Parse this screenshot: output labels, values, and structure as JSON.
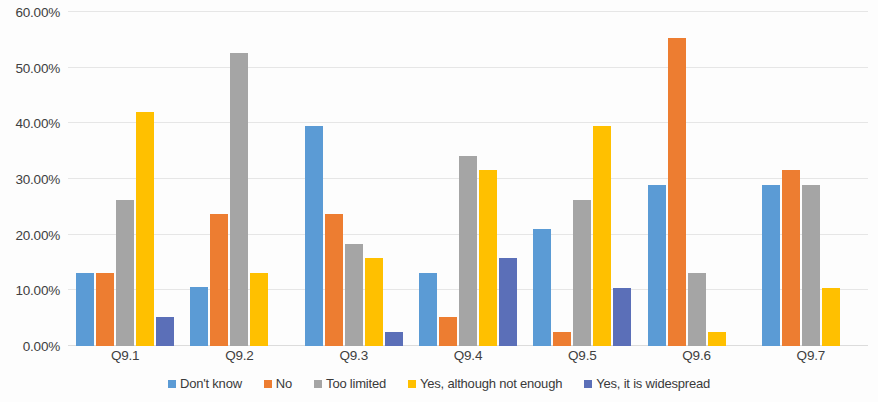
{
  "chart_data": {
    "type": "bar",
    "title": "",
    "subtitle": "",
    "xlabel": "",
    "ylabel": "",
    "categories": [
      "Q9.1",
      "Q9.2",
      "Q9.3",
      "Q9.4",
      "Q9.5",
      "Q9.6",
      "Q9.7"
    ],
    "ylim": [
      0,
      60
    ],
    "ytick_values": [
      0,
      10,
      20,
      30,
      40,
      50,
      60
    ],
    "ytick_labels": [
      "0.00%",
      "10.00%",
      "20.00%",
      "30.00%",
      "40.00%",
      "50.00%",
      "60.00%"
    ],
    "grid": true,
    "legend_position": "bottom",
    "grouping": "clustered",
    "value_suffix": "%",
    "series": [
      {
        "name": "Don't know",
        "color": "#5B9BD5",
        "values": [
          13.2,
          10.6,
          39.5,
          13.2,
          21.1,
          28.9,
          28.9
        ]
      },
      {
        "name": "No",
        "color": "#ED7D31",
        "values": [
          13.2,
          23.7,
          23.7,
          5.3,
          2.6,
          55.3,
          31.6
        ]
      },
      {
        "name": "Too limited",
        "color": "#A5A5A5",
        "values": [
          26.3,
          52.6,
          18.4,
          34.2,
          26.3,
          13.2,
          28.9
        ]
      },
      {
        "name": "Yes, although not enough",
        "color": "#FFC000",
        "values": [
          42.1,
          13.2,
          15.8,
          31.6,
          39.5,
          2.6,
          10.5
        ]
      },
      {
        "name": "Yes, it is widespread",
        "color": "#5B6FB8",
        "values": [
          5.3,
          null,
          2.6,
          15.8,
          10.5,
          null,
          null
        ]
      }
    ]
  },
  "legend": {
    "items": [
      {
        "label": "Don't know",
        "color": "#5B9BD5"
      },
      {
        "label": "No",
        "color": "#ED7D31"
      },
      {
        "label": "Too limited",
        "color": "#A5A5A5"
      },
      {
        "label": "Yes, although not enough",
        "color": "#FFC000"
      },
      {
        "label": "Yes, it is widespread",
        "color": "#5B6FB8"
      }
    ]
  }
}
